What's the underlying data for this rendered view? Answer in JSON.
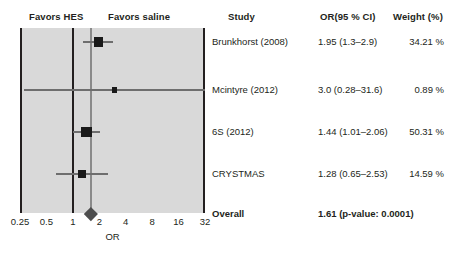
{
  "headers": {
    "favors_left": "Favors HES",
    "favors_right": "Favors saline",
    "study": "Study",
    "or_ci": "OR(95 % CI)",
    "weight": "Weight (%)"
  },
  "chart_data": {
    "type": "forest",
    "title": "",
    "xlabel": "OR",
    "ylabel": "",
    "xscale": "log",
    "xlim": [
      0.25,
      32
    ],
    "ticks": [
      "0.25",
      "0.5",
      "1",
      "2",
      "4",
      "8",
      "16",
      "32"
    ],
    "tick_values": [
      0.25,
      0.5,
      1,
      2,
      4,
      8,
      16,
      32
    ],
    "null_value": 1,
    "pooled_value": 1.61,
    "grid": false,
    "legend": "none",
    "favors_left_label": "Favors HES",
    "favors_right_label": "Favors saline",
    "rows": [
      {
        "study": "Brunkhorst (2008)",
        "or": 1.95,
        "ci_low": 1.3,
        "ci_high": 2.9,
        "or_ci_text": "1.95 (1.3–2.9)",
        "weight": 34.21,
        "weight_text": "34.21 %"
      },
      {
        "study": "Mcintyre (2012)",
        "or": 3.0,
        "ci_low": 0.28,
        "ci_high": 31.6,
        "or_ci_text": "3.0 (0.28–31.6)",
        "weight": 0.89,
        "weight_text": "0.89 %"
      },
      {
        "study": "6S (2012)",
        "or": 1.44,
        "ci_low": 1.01,
        "ci_high": 2.06,
        "or_ci_text": "1.44 (1.01–2.06)",
        "weight": 50.31,
        "weight_text": "50.31 %"
      },
      {
        "study": "CRYSTMAS",
        "or": 1.28,
        "ci_low": 0.65,
        "ci_high": 2.53,
        "or_ci_text": "1.28 (0.65–2.53)",
        "weight": 14.59,
        "weight_text": "14.59 %"
      }
    ],
    "overall": {
      "study": "Overall",
      "or": 1.61,
      "ci_low": 1.26,
      "ci_high": 2.04,
      "or_ci_text": "1.61 (p-value: 0.0001)",
      "p_value": "0.0001",
      "weight_text": ""
    },
    "colors": {
      "plot_background": "#d9d9d9",
      "axis": "#231f20",
      "marker": "#1a1a1a",
      "ci": "#6e6e6e",
      "pooled_line": "#8a8a8a",
      "diamond": "#4d4d4d",
      "text": "#231f20"
    }
  }
}
